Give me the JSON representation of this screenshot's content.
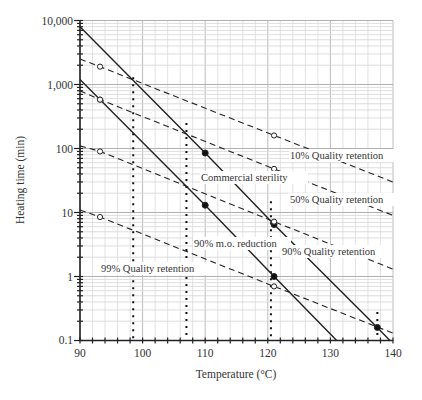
{
  "chart_data": {
    "type": "line",
    "title": "",
    "xlabel": "Temperature (°C)",
    "ylabel": "Heating time (min)",
    "xlim": [
      90,
      140
    ],
    "ylim": [
      0.1,
      10000
    ],
    "yscale": "log",
    "grid": true,
    "legend": "none (inline labels)",
    "x_ticks": [
      90,
      100,
      110,
      120,
      130,
      140
    ],
    "x_tick_labels": [
      "90",
      "100",
      "110",
      "120",
      "130",
      "140"
    ],
    "y_ticks": [
      0.1,
      1,
      10,
      100,
      1000,
      10000
    ],
    "y_tick_labels": [
      "0.1",
      "1",
      "10",
      "100",
      "1,000",
      "10,000"
    ],
    "series": [
      {
        "name": "Commercial sterility",
        "style": "solid",
        "points": [
          [
            90,
            8000
          ],
          [
            110,
            85
          ],
          [
            121,
            6.5
          ],
          [
            137.5,
            0.16
          ],
          [
            139.5,
            0.1
          ]
        ],
        "markers": [
          [
            110,
            85,
            "filled"
          ],
          [
            121,
            6.5,
            "filled"
          ],
          [
            137.5,
            0.16,
            "filled"
          ]
        ],
        "label_pos": [
          107,
          42
        ]
      },
      {
        "name": "90% m.o. reduction",
        "style": "solid",
        "points": [
          [
            90,
            1200
          ],
          [
            110,
            13
          ],
          [
            121,
            1.0
          ],
          [
            131,
            0.1
          ]
        ],
        "markers": [
          [
            93.2,
            580,
            "open"
          ],
          [
            110,
            13,
            "filled"
          ],
          [
            121,
            1.0,
            "filled"
          ]
        ],
        "label_pos": [
          104.5,
          2.7
        ]
      },
      {
        "name": "10% Quality retention",
        "style": "dashed",
        "points": [
          [
            90,
            2500
          ],
          [
            93.2,
            1900
          ],
          [
            121,
            160
          ],
          [
            140,
            30
          ]
        ],
        "markers": [
          [
            93.2,
            1900,
            "open"
          ],
          [
            121,
            160,
            "open"
          ]
        ],
        "label_pos": [
          124,
          90
        ]
      },
      {
        "name": "50% Quality retention",
        "style": "dashed",
        "points": [
          [
            90,
            800
          ],
          [
            93.2,
            580
          ],
          [
            121,
            48
          ],
          [
            140,
            9
          ]
        ],
        "markers": [
          [
            93.2,
            580,
            "open"
          ],
          [
            121,
            48,
            "open"
          ]
        ],
        "label_pos": [
          124,
          12
        ]
      },
      {
        "name": "90% Quality retention",
        "style": "dashed",
        "points": [
          [
            90,
            110
          ],
          [
            93.2,
            90
          ],
          [
            121,
            7.2
          ],
          [
            140,
            1.3
          ]
        ],
        "markers": [
          [
            93.2,
            90,
            "open"
          ],
          [
            121,
            7.2,
            "open"
          ]
        ],
        "label_pos": [
          122.5,
          2.4
        ]
      },
      {
        "name": "99% Quality retention",
        "style": "dashed",
        "points": [
          [
            90,
            11
          ],
          [
            93.2,
            8.5
          ],
          [
            121,
            0.7
          ],
          [
            140,
            0.13
          ]
        ],
        "markers": [
          [
            93.2,
            8.5,
            "open"
          ],
          [
            121,
            0.7,
            "open"
          ]
        ],
        "label_pos": [
          91.5,
          1.15
        ]
      }
    ],
    "reference_lines": [
      {
        "style": "dotted",
        "x": 98.5,
        "y_top": 1300
      },
      {
        "style": "dotted",
        "x": 107,
        "y_top": 250
      },
      {
        "style": "dotted",
        "x": 120.5,
        "y_top": 15
      },
      {
        "style": "dotted",
        "x": 137.5,
        "y_top": 0.28
      }
    ]
  },
  "labels": {
    "xlabel": "Temperature (°C)",
    "ylabel": "Heating time (min)",
    "commercial_sterility": "Commercial sterility",
    "mo_reduction": "90% m.o. reduction",
    "qr10": "10% Quality retention",
    "qr50": "50% Quality retention",
    "qr90": "90% Quality retention",
    "qr99": "99% Quality retention"
  },
  "x_tick_labels": [
    "90",
    "100",
    "110",
    "120",
    "130",
    "140"
  ],
  "y_tick_labels": [
    "10,000",
    "1,000",
    "100",
    "10",
    "1",
    "0.1"
  ]
}
